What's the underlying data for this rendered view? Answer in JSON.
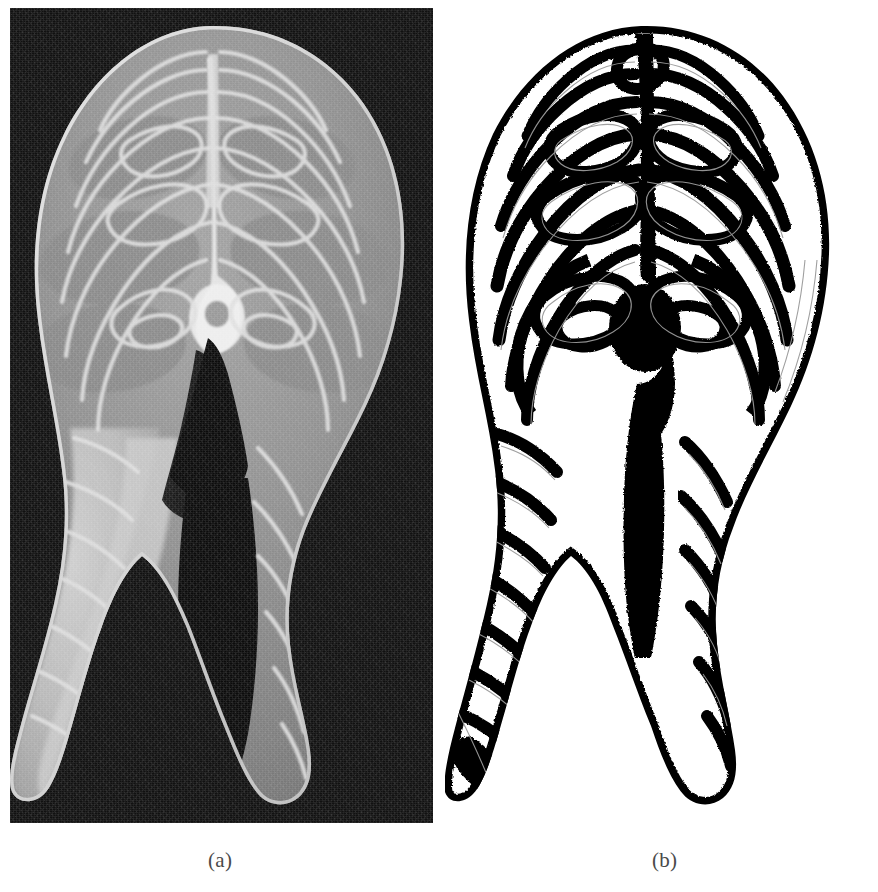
{
  "figure": {
    "kind": "two-panel scientific figure",
    "background_color": "#ffffff",
    "panels": [
      {
        "id": "a",
        "caption": "(a)",
        "type": "grayscale-photograph",
        "subject": "fish cross-section steak (salmon cutlet) on black background",
        "background_color": "#0b0b0b",
        "flesh_color": "#8b8b8b",
        "connective_tissue_color": "#d8d8d8",
        "bone_highlight_color": "#efefef",
        "frame": {
          "x": 10,
          "y": 8,
          "width": 423,
          "height": 815
        }
      },
      {
        "id": "b",
        "caption": "(b)",
        "type": "binary-segmentation",
        "subject": "binarized myocommata / connective-tissue network of the same cutlet",
        "background_color": "#ffffff",
        "segment_color": "#000000",
        "trace_line_color": "#9a9a9a",
        "frame": {
          "x": 445,
          "y": 10,
          "width": 423,
          "height": 812
        }
      }
    ]
  },
  "captions": {
    "panel_a": "(a)",
    "panel_b": "(b)"
  },
  "colors": {
    "page_background": "#ffffff",
    "photo_background": "#0b0b0b",
    "flesh_mid_gray": "#8b8b8b",
    "flesh_light_gray": "#b9b9b9",
    "tissue_white": "#e4e4e4",
    "binary_black": "#000000",
    "binary_white": "#ffffff",
    "caption_text": "#4a4a4a"
  }
}
